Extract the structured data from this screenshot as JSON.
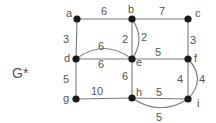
{
  "title": "G*",
  "nodes": [
    {
      "id": "a",
      "label": "a",
      "x": 77,
      "y": 19,
      "lx": 66,
      "ly": 17
    },
    {
      "id": "b",
      "label": "b",
      "x": 132,
      "y": 19,
      "lx": 128,
      "ly": 13
    },
    {
      "id": "c",
      "label": "c",
      "x": 188,
      "y": 19,
      "lx": 195,
      "ly": 17
    },
    {
      "id": "d",
      "label": "d",
      "x": 76,
      "y": 59,
      "lx": 64,
      "ly": 62
    },
    {
      "id": "e",
      "label": "e",
      "x": 132,
      "y": 59,
      "lx": 136,
      "ly": 66
    },
    {
      "id": "f",
      "label": "f",
      "x": 188,
      "y": 59,
      "lx": 194,
      "ly": 62
    },
    {
      "id": "g",
      "label": "g",
      "x": 76,
      "y": 99,
      "lx": 63,
      "ly": 102
    },
    {
      "id": "h",
      "label": "h",
      "x": 132,
      "y": 98,
      "lx": 136,
      "ly": 96
    },
    {
      "id": "i",
      "label": "i",
      "x": 188,
      "y": 99,
      "lx": 197,
      "ly": 107
    }
  ],
  "edges": [
    {
      "from": "a",
      "to": "b",
      "weight": "6",
      "wx": 104,
      "wy": 15,
      "curve": null
    },
    {
      "from": "b",
      "to": "c",
      "weight": "7",
      "wx": 162,
      "wy": 15,
      "curve": null
    },
    {
      "from": "a",
      "to": "d",
      "weight": "3",
      "wx": 66,
      "wy": 43,
      "curve": null
    },
    {
      "from": "b",
      "to": "e",
      "weight": "2",
      "wx": 125,
      "wy": 43,
      "curve": null
    },
    {
      "from": "b",
      "to": "e",
      "weight": "2",
      "wx": 144,
      "wy": 41,
      "curve": "M132,19 Q146,39 132,59"
    },
    {
      "from": "c",
      "to": "f",
      "weight": "3",
      "wx": 193,
      "wy": 44,
      "curve": null
    },
    {
      "from": "d",
      "to": "e",
      "weight": "6",
      "wx": 101,
      "wy": 50,
      "curve": "M76,59 Q104,38 132,59"
    },
    {
      "from": "d",
      "to": "e",
      "weight": "6",
      "wx": 101,
      "wy": 68,
      "curve": null
    },
    {
      "from": "e",
      "to": "f",
      "weight": "5",
      "wx": 158,
      "wy": 56,
      "curve": null
    },
    {
      "from": "d",
      "to": "g",
      "weight": "5",
      "wx": 66,
      "wy": 83,
      "curve": null
    },
    {
      "from": "e",
      "to": "h",
      "weight": "6",
      "wx": 125,
      "wy": 80,
      "curve": null
    },
    {
      "from": "f",
      "to": "i",
      "weight": "4",
      "wx": 180,
      "wy": 83,
      "curve": null
    },
    {
      "from": "f",
      "to": "i",
      "weight": "4",
      "wx": 202,
      "wy": 83,
      "curve": "M188,59 Q207,79 188,99"
    },
    {
      "from": "g",
      "to": "h",
      "weight": "10",
      "wx": 97,
      "wy": 95,
      "curve": null
    },
    {
      "from": "h",
      "to": "i",
      "weight": "5",
      "wx": 159,
      "wy": 96,
      "curve": null
    },
    {
      "from": "h",
      "to": "i",
      "weight": "5",
      "wx": 159,
      "wy": 121,
      "curve": "M132,98 Q160,117 188,99"
    }
  ],
  "title_pos": {
    "x": 12,
    "y": 78
  }
}
